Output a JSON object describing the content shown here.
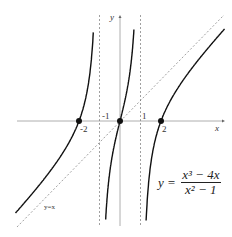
{
  "chart_data": {
    "type": "line",
    "title": "",
    "function": "y = (x^3 - 4x)/(x^2 - 1)",
    "equation_label": {
      "lhs": "y =",
      "numerator": "x³ − 4x",
      "denominator": "x² − 1"
    },
    "xlabel": "x",
    "ylabel": "y",
    "x_ticks": [
      "-2",
      "-1",
      "1",
      "2"
    ],
    "zeros": [
      -2,
      0,
      2
    ],
    "vertical_asymptotes": [
      -1,
      1
    ],
    "oblique_asymptote": {
      "label": "y=x",
      "slope": 1,
      "intercept": 0
    },
    "xlim": [
      -5.2,
      5.2
    ],
    "ylim": [
      -5.2,
      5.2
    ],
    "grid": false
  }
}
